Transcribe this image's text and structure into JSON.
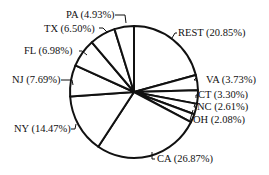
{
  "chart_data": {
    "type": "pie",
    "title": "",
    "start_angle_deg": 0,
    "direction": "clockwise",
    "slices": [
      {
        "label": "REST",
        "value": 20.85,
        "text": "REST (20.85%)"
      },
      {
        "label": "VA",
        "value": 3.73,
        "text": "VA (3.73%)"
      },
      {
        "label": "CT",
        "value": 3.3,
        "text": "CT (3.30%)"
      },
      {
        "label": "NC",
        "value": 2.61,
        "text": "NC (2.61%)"
      },
      {
        "label": "OH",
        "value": 2.08,
        "text": "OH (2.08%)"
      },
      {
        "label": "CA",
        "value": 26.87,
        "text": "CA (26.87%)"
      },
      {
        "label": "NY",
        "value": 14.47,
        "text": "NY (14.47%)"
      },
      {
        "label": "NJ",
        "value": 7.69,
        "text": "NJ (7.69%)"
      },
      {
        "label": "FL",
        "value": 6.98,
        "text": "FL (6.98%)"
      },
      {
        "label": "TX",
        "value": 6.5,
        "text": "TX (6.50%)"
      },
      {
        "label": "PA",
        "value": 4.93,
        "text": "PA (4.93%)"
      }
    ],
    "colors": {
      "fill": "#ffffff",
      "stroke": "#111111"
    }
  },
  "labels": {
    "rest": "REST (20.85%)",
    "va": "VA (3.73%)",
    "ct": "CT (3.30%)",
    "nc": "NC (2.61%)",
    "oh": "OH (2.08%)",
    "ca": "CA (26.87%)",
    "ny": "NY (14.47%)",
    "nj": "NJ (7.69%)",
    "fl": "FL (6.98%)",
    "tx": "TX (6.50%)",
    "pa": "PA (4.93%)"
  }
}
